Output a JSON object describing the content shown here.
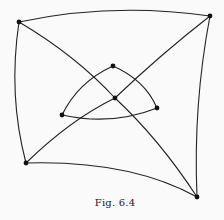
{
  "caption": "Fig. 6.4",
  "colors": {
    "background": "#fafafa",
    "stroke": "#222222",
    "node": "#111111"
  },
  "graph": {
    "nodes": [
      {
        "id": "outer-top-left",
        "x": 19,
        "y": 22
      },
      {
        "id": "outer-top-right",
        "x": 210,
        "y": 16
      },
      {
        "id": "outer-bottom-left",
        "x": 26,
        "y": 163
      },
      {
        "id": "outer-bottom-right",
        "x": 197,
        "y": 197
      },
      {
        "id": "inner-top",
        "x": 113,
        "y": 66
      },
      {
        "id": "center",
        "x": 115,
        "y": 98
      },
      {
        "id": "inner-right",
        "x": 157,
        "y": 108
      },
      {
        "id": "inner-left",
        "x": 62,
        "y": 115
      }
    ],
    "edges": [
      {
        "from": "outer-top-left",
        "to": "outer-top-right"
      },
      {
        "from": "outer-top-right",
        "to": "outer-bottom-right"
      },
      {
        "from": "outer-bottom-right",
        "to": "outer-bottom-left"
      },
      {
        "from": "outer-bottom-left",
        "to": "outer-top-left"
      },
      {
        "from": "outer-top-left",
        "to": "center"
      },
      {
        "from": "center",
        "to": "outer-bottom-right"
      },
      {
        "from": "outer-bottom-left",
        "to": "center"
      },
      {
        "from": "center",
        "to": "outer-top-right"
      },
      {
        "from": "inner-top",
        "to": "inner-left"
      },
      {
        "from": "inner-top",
        "to": "inner-right"
      },
      {
        "from": "inner-left",
        "to": "inner-right"
      }
    ]
  }
}
